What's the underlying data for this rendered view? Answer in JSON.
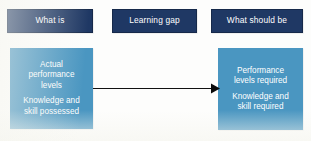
{
  "diagram": {
    "type": "learning-gap-diagram",
    "background_color": "#fdfdfc",
    "colors": {
      "header_fill": "#1f3864",
      "body_fill": "#4a96c1",
      "text": "#ffffff",
      "arrow": "#000000"
    },
    "headers": [
      {
        "id": "what-is",
        "label": "What is"
      },
      {
        "id": "learning-gap",
        "label": "Learning gap"
      },
      {
        "id": "what-should-be",
        "label": "What should be"
      }
    ],
    "panels": {
      "current_state": {
        "group_a": [
          "Actual",
          "performance",
          "levels"
        ],
        "group_b": [
          "Knowledge and",
          "skill possessed"
        ]
      },
      "desired_state": {
        "group_a": [
          "Performance",
          "levels required"
        ],
        "group_b": [
          "Knowledge and",
          "skill required"
        ]
      }
    },
    "arrow": {
      "name": "gap-arrow",
      "direction": "right",
      "from": "current_state",
      "to": "desired_state"
    }
  }
}
